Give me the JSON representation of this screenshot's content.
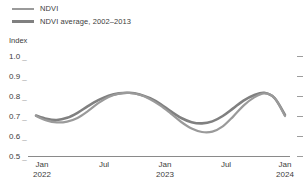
{
  "chart_data": {
    "type": "line",
    "title": "",
    "subtitle": "",
    "xlabel": "",
    "ylabel": "Index",
    "ylim": [
      0.5,
      1.0
    ],
    "ytick_labels": [
      "1.0",
      "0.9",
      "0.8",
      "0.7",
      "0.6",
      "0.5"
    ],
    "ytick_values": [
      1.0,
      0.9,
      0.8,
      0.7,
      0.6,
      0.5
    ],
    "xtick_labels": [
      "Jan",
      "Jul",
      "Jan",
      "Jul",
      "Jan"
    ],
    "xtick_years": [
      "2022",
      "",
      "2023",
      "",
      "2024"
    ],
    "x": [
      "2022-01",
      "2022-02",
      "2022-03",
      "2022-04",
      "2022-05",
      "2022-06",
      "2022-07",
      "2022-08",
      "2022-09",
      "2022-10",
      "2022-11",
      "2022-12",
      "2023-01",
      "2023-02",
      "2023-03",
      "2023-04",
      "2023-05",
      "2023-06",
      "2023-07",
      "2023-08",
      "2023-09",
      "2023-10",
      "2023-11",
      "2023-12",
      "2024-01"
    ],
    "grid": false,
    "legend_position": "top-left",
    "series": [
      {
        "name": "NDVI",
        "color": "#9a9a9a",
        "values": [
          0.7,
          0.678,
          0.668,
          0.672,
          0.69,
          0.724,
          0.764,
          0.795,
          0.812,
          0.815,
          0.806,
          0.784,
          0.752,
          0.712,
          0.67,
          0.637,
          0.62,
          0.622,
          0.648,
          0.697,
          0.752,
          0.792,
          0.813,
          0.79,
          0.7
        ]
      },
      {
        "name": "NDVI average, 2002–2013",
        "color": "#808080",
        "values": [
          0.702,
          0.686,
          0.68,
          0.691,
          0.716,
          0.749,
          0.779,
          0.801,
          0.813,
          0.816,
          0.808,
          0.789,
          0.76,
          0.723,
          0.69,
          0.669,
          0.663,
          0.673,
          0.7,
          0.738,
          0.777,
          0.804,
          0.816,
          0.789,
          0.705
        ]
      }
    ]
  },
  "legend": {
    "items": [
      {
        "label": "NDVI"
      },
      {
        "label": "NDVI average, 2002–2013"
      }
    ]
  },
  "yaxis": {
    "title": "Index",
    "ticks": [
      "1.0",
      "0.9",
      "0.8",
      "0.7",
      "0.6",
      "0.5"
    ]
  },
  "xaxis": {
    "ticks": [
      {
        "month": "Jan",
        "year": "2022"
      },
      {
        "month": "Jul",
        "year": ""
      },
      {
        "month": "Jan",
        "year": "2023"
      },
      {
        "month": "Jul",
        "year": ""
      },
      {
        "month": "Jan",
        "year": "2024"
      }
    ]
  }
}
